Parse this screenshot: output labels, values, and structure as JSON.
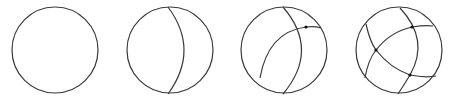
{
  "figure": {
    "stroke_color": "#3a3a3a",
    "background": "#ffffff",
    "panels": [
      {
        "index": 1,
        "arcs": 0,
        "vertices": 0
      },
      {
        "index": 2,
        "arcs": 1,
        "vertices": 0
      },
      {
        "index": 3,
        "arcs": 2,
        "vertices": 1
      },
      {
        "index": 4,
        "arcs": 3,
        "vertices": 3
      }
    ]
  }
}
